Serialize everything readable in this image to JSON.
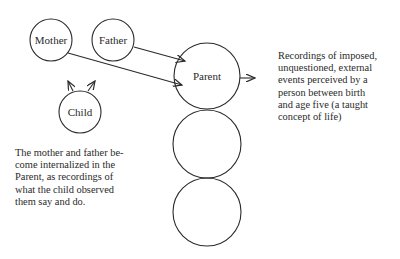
{
  "diagram": {
    "nodes": {
      "mother": "Mother",
      "father": "Father",
      "child": "Child",
      "parent": "Parent"
    },
    "parent_description": [
      "Recordings of imposed,",
      "unquestioned, external",
      "events perceived by a",
      "person between birth",
      "and age five (a taught",
      "concept of life)"
    ],
    "internalization_note": [
      "The mother and father be-",
      "come internalized in the",
      "Parent, as recordings of",
      "what the child observed",
      "them say and do."
    ],
    "colors": {
      "stroke": "#2a2a2a",
      "background": "#ffffff"
    }
  }
}
